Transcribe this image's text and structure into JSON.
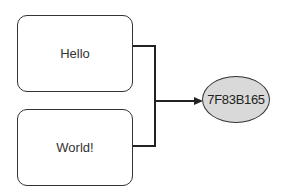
{
  "nodes": {
    "input1": {
      "label": "Hello"
    },
    "input2": {
      "label": "World!"
    },
    "output": {
      "label": "7F83B165",
      "fill": "#d9d9d9"
    }
  },
  "edges": [
    {
      "from": "input1",
      "to": "output"
    },
    {
      "from": "input2",
      "to": "output"
    }
  ]
}
